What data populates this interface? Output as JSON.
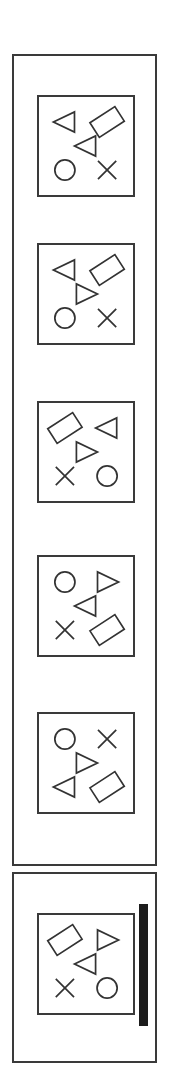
{
  "app": {
    "title": "Shape Grid Panels",
    "background_color": "#ffffff",
    "border_color": "#3a3a3a",
    "glyph_stroke_color": "#333333",
    "scrollbar_color": "#1c1c1c"
  },
  "containers": [
    {
      "name": "panel-list-container",
      "card_count": 5
    },
    {
      "name": "panel-scroll-container",
      "card_count": 1,
      "has_scrollbar": true
    }
  ],
  "scrollbar": {
    "name": "vertical-scrollbar",
    "orientation": "vertical",
    "thumb_color": "#1c1c1c",
    "position_percent": 0
  },
  "cards": [
    {
      "index": 1,
      "label": "shape-card-1",
      "slots": {
        "top_left": "triangle-left",
        "top_right": "diamond",
        "center": "triangle-left",
        "bottom_left": "circle",
        "bottom_right": "cross"
      }
    },
    {
      "index": 2,
      "label": "shape-card-2",
      "slots": {
        "top_left": "triangle-left",
        "top_right": "diamond",
        "center": "triangle-right",
        "bottom_left": "circle",
        "bottom_right": "cross"
      }
    },
    {
      "index": 3,
      "label": "shape-card-3",
      "slots": {
        "top_left": "diamond",
        "top_right": "triangle-left",
        "center": "triangle-right",
        "bottom_left": "cross",
        "bottom_right": "circle"
      }
    },
    {
      "index": 4,
      "label": "shape-card-4",
      "slots": {
        "top_left": "circle",
        "top_right": "triangle-right",
        "center": "triangle-left",
        "bottom_left": "cross",
        "bottom_right": "diamond"
      }
    },
    {
      "index": 5,
      "label": "shape-card-5",
      "slots": {
        "top_left": "circle",
        "top_right": "cross",
        "center": "triangle-right",
        "bottom_left": "triangle-left",
        "bottom_right": "diamond"
      }
    },
    {
      "index": 6,
      "label": "shape-card-6",
      "slots": {
        "top_left": "diamond",
        "top_right": "triangle-right",
        "center": "triangle-left",
        "bottom_left": "cross",
        "bottom_right": "circle"
      }
    }
  ],
  "slot_positions": {
    "top_left": {
      "cx": 27,
      "cy": 26
    },
    "top_right": {
      "cx": 71,
      "cy": 26
    },
    "center": {
      "cx": 49,
      "cy": 51
    },
    "bottom_left": {
      "cx": 27,
      "cy": 76
    },
    "bottom_right": {
      "cx": 71,
      "cy": 76
    }
  }
}
